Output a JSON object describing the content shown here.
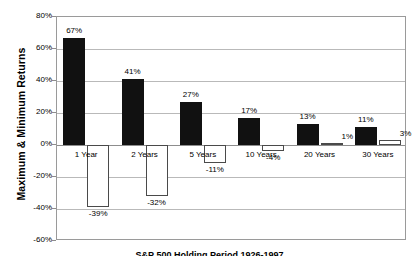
{
  "chart_data": {
    "type": "bar",
    "title": "",
    "caption": "S&P 500 Holding Period 1926-1997",
    "xlabel": "",
    "ylabel": "Maximum & Minimum Returns",
    "categories": [
      "1 Year",
      "2 Years",
      "5 Years",
      "10 Years",
      "20 Years",
      "30 Years"
    ],
    "series": [
      {
        "name": "Maximum",
        "color": "#111111",
        "values": [
          67,
          41,
          27,
          17,
          13,
          11
        ],
        "labels": [
          "67%",
          "41%",
          "27%",
          "17%",
          "13%",
          "11%"
        ]
      },
      {
        "name": "Minimum",
        "color": "#ffffff",
        "values": [
          -39,
          -32,
          -11,
          -4,
          1,
          3
        ],
        "labels": [
          "-39%",
          "-32%",
          "-11%",
          "-4%",
          "1%",
          "3%"
        ]
      }
    ],
    "ylim": [
      -60,
      80
    ],
    "ytick_values": [
      80,
      60,
      40,
      20,
      0,
      -20,
      -40,
      -60
    ],
    "ytick_labels": [
      "80%",
      "60%",
      "40%",
      "20%",
      "0%",
      "-20%",
      "-40%",
      "-60%"
    ],
    "grid": true,
    "legend": "none"
  }
}
